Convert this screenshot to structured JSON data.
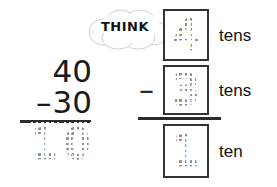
{
  "worksheet": {
    "type": "subtraction-place-value",
    "column_sum": {
      "minuend": "40",
      "operator": "–",
      "subtrahend": "30",
      "answer": "10",
      "answer_style": "dashed-trace",
      "answer_digits": [
        "1",
        "0"
      ]
    },
    "think_bubble": {
      "label": "THINK",
      "icon": "cloud-thought-bubble"
    },
    "place_value": {
      "rows": [
        {
          "operator": "",
          "digit": "4",
          "digit_style": "dashed-trace",
          "unit_label": "tens"
        },
        {
          "operator": "–",
          "digit": "3",
          "digit_style": "dashed-trace",
          "unit_label": "tens"
        },
        {
          "operator": "",
          "digit": "1",
          "digit_style": "dashed-trace",
          "unit_label": "ten"
        }
      ]
    }
  },
  "colors": {
    "ink": "#1a1a1a",
    "rule": "#2b2b2b",
    "box_border": "#333333",
    "trace_gray": "#8d8d8d",
    "background": "#ffffff"
  }
}
